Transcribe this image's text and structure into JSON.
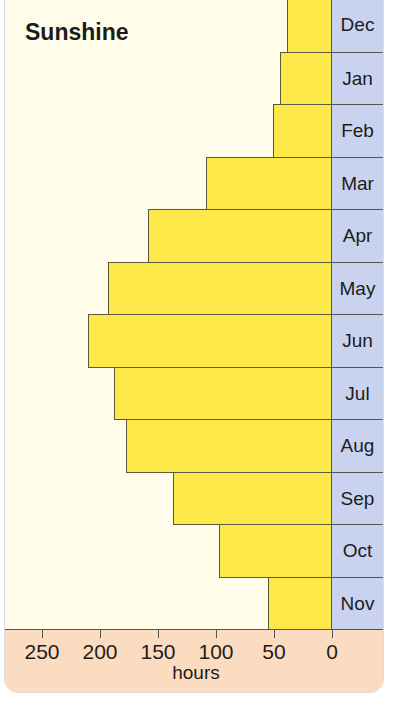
{
  "chart_data": {
    "type": "bar",
    "orientation": "horizontal",
    "title": "Sunshine",
    "xlabel": "hours",
    "ylabel": "",
    "categories": [
      "Dec",
      "Jan",
      "Feb",
      "Mar",
      "Apr",
      "May",
      "Jun",
      "Jul",
      "Aug",
      "Sep",
      "Oct",
      "Nov"
    ],
    "values": [
      39,
      45,
      51,
      109,
      159,
      193,
      210,
      188,
      178,
      137,
      97,
      55
    ],
    "xlim": [
      0,
      250
    ],
    "x_direction": "reversed",
    "xticks": [
      "250",
      "200",
      "150",
      "100",
      "50",
      "0"
    ],
    "grid": false,
    "colors": {
      "bar": "#fde84a",
      "month_column": "#c9d3f0",
      "axis_band": "#fcdcc0",
      "background": "#fffdea"
    }
  }
}
